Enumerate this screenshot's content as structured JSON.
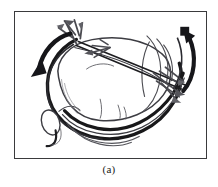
{
  "figure": {
    "caption": "(a)",
    "frame": {
      "border_color": "#3a3a3c",
      "background": "#ffffff",
      "x": 14,
      "y": 11,
      "width": 193,
      "height": 148
    },
    "palette": {
      "ink_dark": "#1c1c1e",
      "ink_mid": "#4a4a4e",
      "ink_light": "#7d7d82",
      "paper": "#ffffff"
    },
    "annotations": [
      {
        "name": "rotation-arrow-left",
        "kind": "curved-arrow",
        "direction": "counter-clockwise, pointing down-left",
        "color": "#1c1c1e"
      },
      {
        "name": "rotation-arrow-right",
        "kind": "curved-arrow",
        "direction": "clockwise, pointing up-left",
        "color": "#1c1c1e"
      },
      {
        "name": "traction-arrow-upper",
        "kind": "feathered-arrow",
        "direction": "pointing up-left",
        "color": "#4a4a4e"
      },
      {
        "name": "traction-arrow-lower",
        "kind": "feathered-arrow",
        "direction": "pointing down-right",
        "color": "#4a4a4e"
      }
    ],
    "anatomy": [
      {
        "name": "liver-body",
        "label": "liver"
      },
      {
        "name": "liver-lobe-right",
        "label": "right lobe"
      },
      {
        "name": "gallbladder",
        "label": "gallbladder"
      },
      {
        "name": "bile-duct",
        "label": "duct"
      },
      {
        "name": "retractor-band-outer",
        "label": "retraction band"
      },
      {
        "name": "retractor-band-inner",
        "label": "retraction band"
      },
      {
        "name": "instrument-shaft",
        "label": "instrument shaft"
      }
    ]
  }
}
